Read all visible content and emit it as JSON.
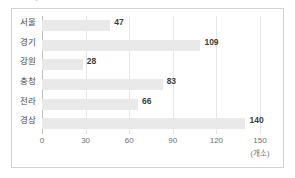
{
  "header": {
    "clipped_text": "●               "
  },
  "axis_unit": "(개소)",
  "colors": {
    "bar": "#e9e9e9",
    "gridline": "#e6e6e6",
    "axis": "#bdbdbd",
    "border": "#d2d2d2",
    "value_text": "#3d3d3d",
    "label_text": "#4a4a4a",
    "tick_text": "#6f6f6f"
  },
  "chart_data": {
    "type": "bar",
    "orientation": "horizontal",
    "title": "",
    "xlabel": "(개소)",
    "ylabel": "",
    "categories": [
      "서울",
      "경기",
      "강원",
      "충청",
      "전라",
      "경상"
    ],
    "values": [
      47,
      109,
      28,
      83,
      66,
      140
    ],
    "value_labels": [
      "47",
      "109",
      "28",
      "83",
      "66",
      "140"
    ],
    "xticks": [
      0,
      30,
      60,
      90,
      120,
      150
    ],
    "xtick_labels": [
      "0",
      "30",
      "60",
      "90",
      "120",
      "150"
    ],
    "xlim": [
      0,
      150
    ],
    "grid": true,
    "grid_axis": "x",
    "legend": false
  }
}
